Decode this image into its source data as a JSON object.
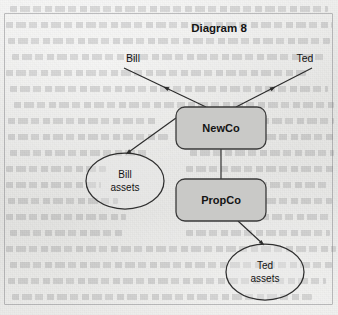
{
  "figure": {
    "title": "Diagram 8",
    "title_position": {
      "x": 219,
      "y": 32
    }
  },
  "nodes": {
    "boxes": [
      {
        "id": "newco",
        "label": "NewCo",
        "shape": "rounded-rectangle",
        "fill": "#c9c9c7",
        "stroke": "#3a3a3a",
        "x": 176,
        "y": 107,
        "width": 90,
        "height": 42,
        "rx": 9,
        "label_x": 221,
        "label_y": 132
      },
      {
        "id": "propco",
        "label": "PropCo",
        "shape": "rounded-rectangle",
        "fill": "#c9c9c7",
        "stroke": "#3a3a3a",
        "x": 176,
        "y": 179,
        "width": 90,
        "height": 42,
        "rx": 9,
        "label_x": 221,
        "label_y": 204
      }
    ],
    "ellipses": [
      {
        "id": "bill-assets",
        "label_lines": [
          "Bill",
          "assets"
        ],
        "shape": "ellipse",
        "fill": "#e9e9e7",
        "stroke": "#2f2f2f",
        "cx": 125,
        "cy": 181,
        "rx": 39,
        "ry": 28,
        "label_x": 125,
        "label_y": 178
      },
      {
        "id": "ted-assets",
        "label_lines": [
          "Ted",
          "assets"
        ],
        "shape": "ellipse",
        "fill": "#e9e9e7",
        "stroke": "#2f2f2f",
        "cx": 265,
        "cy": 272,
        "rx": 39,
        "ry": 28,
        "label_x": 265,
        "label_y": 269
      }
    ],
    "person_labels": [
      {
        "id": "bill",
        "label": "Bill",
        "x": 133,
        "y": 62,
        "anchor": "middle"
      },
      {
        "id": "ted",
        "label": "Ted",
        "x": 305,
        "y": 62,
        "anchor": "middle"
      }
    ]
  },
  "connectors": [
    {
      "id": "newco-to-bill",
      "from": "newco",
      "to": "bill",
      "x1": 206,
      "y1": 107,
      "x2": 124,
      "y2": 68,
      "arrow": true,
      "arrow_at": "mid",
      "arrow_direction": "toward-bill"
    },
    {
      "id": "newco-to-ted",
      "from": "newco",
      "to": "ted",
      "x1": 236,
      "y1": 107,
      "x2": 312,
      "y2": 68,
      "arrow": true,
      "arrow_at": "mid",
      "arrow_direction": "toward-ted"
    },
    {
      "id": "newco-to-propco",
      "from": "newco",
      "to": "propco",
      "x1": 221,
      "y1": 149,
      "x2": 221,
      "y2": 179,
      "arrow": false
    },
    {
      "id": "newco-to-bill-assets",
      "from": "newco",
      "to": "bill-assets",
      "x1": 176,
      "y1": 118,
      "x2": 126,
      "y2": 154,
      "arrow": true,
      "arrow_at": "end",
      "arrow_direction": "down-left"
    },
    {
      "id": "propco-to-ted-assets",
      "from": "propco",
      "to": "ted-assets",
      "x1": 238,
      "y1": 221,
      "x2": 264,
      "y2": 245,
      "arrow": true,
      "arrow_at": "end",
      "arrow_direction": "down-right"
    }
  ],
  "style": {
    "page_background": "#e8e8e6",
    "box_fill": "#c9c9c7",
    "ellipse_fill": "#e9e9e7",
    "line_color": "#2b2b2b",
    "text_color": "#141414",
    "frame_color": "#787a7d"
  },
  "bleed_text_lines": [
    {
      "x": 10,
      "y": 6,
      "w": 318
    },
    {
      "x": 6,
      "y": 22,
      "w": 326
    },
    {
      "x": 8,
      "y": 38,
      "w": 322
    },
    {
      "x": 12,
      "y": 54,
      "w": 312
    },
    {
      "x": 6,
      "y": 70,
      "w": 300
    },
    {
      "x": 10,
      "y": 86,
      "w": 318
    },
    {
      "x": 14,
      "y": 102,
      "w": 180
    },
    {
      "x": 8,
      "y": 118,
      "w": 150
    },
    {
      "x": 8,
      "y": 134,
      "w": 160
    },
    {
      "x": 10,
      "y": 150,
      "w": 140
    },
    {
      "x": 6,
      "y": 166,
      "w": 100
    },
    {
      "x": 6,
      "y": 182,
      "w": 95
    },
    {
      "x": 8,
      "y": 198,
      "w": 110
    },
    {
      "x": 6,
      "y": 214,
      "w": 120
    },
    {
      "x": 10,
      "y": 230,
      "w": 115
    },
    {
      "x": 6,
      "y": 246,
      "w": 330
    },
    {
      "x": 10,
      "y": 262,
      "w": 322
    },
    {
      "x": 8,
      "y": 278,
      "w": 318
    },
    {
      "x": 12,
      "y": 294,
      "w": 300
    },
    {
      "x": 188,
      "y": 102,
      "w": 146
    },
    {
      "x": 192,
      "y": 118,
      "w": 142
    },
    {
      "x": 186,
      "y": 134,
      "w": 148
    },
    {
      "x": 190,
      "y": 150,
      "w": 144
    },
    {
      "x": 186,
      "y": 166,
      "w": 148
    },
    {
      "x": 190,
      "y": 182,
      "w": 140
    },
    {
      "x": 186,
      "y": 198,
      "w": 146
    },
    {
      "x": 192,
      "y": 214,
      "w": 138
    },
    {
      "x": 186,
      "y": 230,
      "w": 144
    }
  ]
}
